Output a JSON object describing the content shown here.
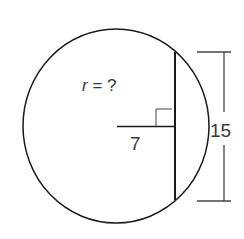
{
  "diagram": {
    "unknown_label": "r = ?",
    "unknown_variable": "r",
    "unknown_rest": " = ?",
    "distance_label": "7",
    "chord_length_label": "15",
    "colors": {
      "stroke": "#1a1a1a",
      "dimension": "#444444",
      "text": "#3a3a3a",
      "background": "#ffffff"
    }
  }
}
